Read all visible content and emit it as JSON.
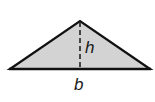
{
  "diagram": {
    "type": "triangle-area-figure",
    "labels": {
      "height": "h",
      "base": "b"
    },
    "colors": {
      "fill": "#d3d3d3",
      "stroke": "#111111",
      "background": "#ffffff"
    },
    "geometry": {
      "apex": [
        80,
        21
      ],
      "base_left": [
        10,
        69
      ],
      "base_right": [
        150,
        69
      ],
      "altitude_foot": [
        80,
        69
      ]
    }
  }
}
